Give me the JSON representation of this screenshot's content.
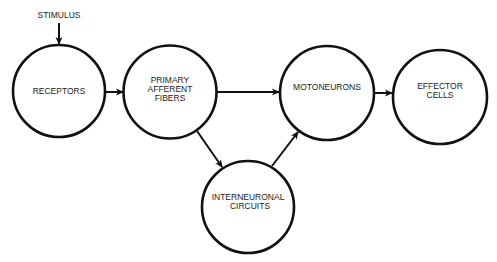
{
  "diagram": {
    "type": "flow",
    "input": {
      "label": "STIMULUS"
    },
    "nodes": [
      {
        "id": "receptors",
        "lines": [
          "RECEPTORS"
        ]
      },
      {
        "id": "primary-afferent-fibers",
        "lines": [
          "PRIMARY",
          "AFFERENT",
          "FIBERS"
        ]
      },
      {
        "id": "motoneurons",
        "lines": [
          "MOTONEURONS"
        ]
      },
      {
        "id": "effector-cells",
        "lines": [
          "EFFECTOR",
          "CELLS"
        ]
      },
      {
        "id": "interneuronal-circuits",
        "lines": [
          "INTERNEURONAL",
          "CIRCUITS"
        ]
      }
    ],
    "edges": [
      {
        "from": "stimulus",
        "to": "receptors"
      },
      {
        "from": "receptors",
        "to": "primary-afferent-fibers"
      },
      {
        "from": "primary-afferent-fibers",
        "to": "motoneurons"
      },
      {
        "from": "primary-afferent-fibers",
        "to": "interneuronal-circuits"
      },
      {
        "from": "interneuronal-circuits",
        "to": "motoneurons"
      },
      {
        "from": "motoneurons",
        "to": "effector-cells"
      }
    ]
  }
}
